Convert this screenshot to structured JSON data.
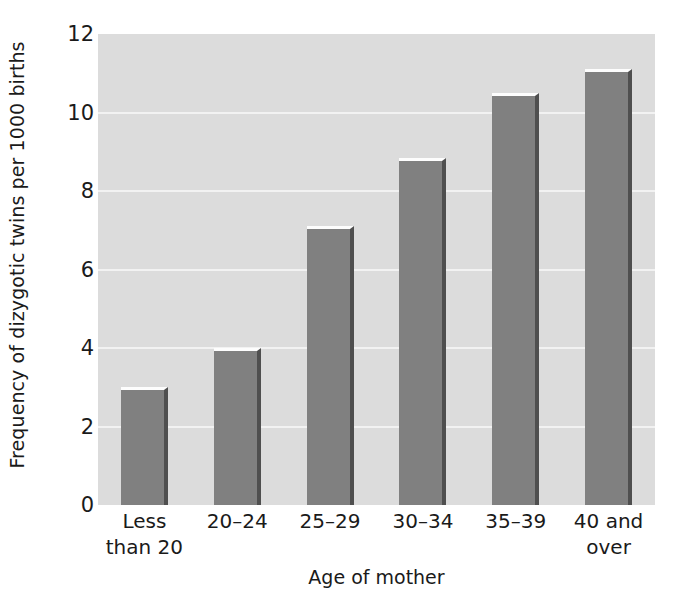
{
  "chart_data": {
    "type": "bar",
    "title": "",
    "xlabel": "Age of mother",
    "ylabel": "Frequency of dizygotic twins per 1000 births",
    "categories": [
      "Less than 20",
      "20–24",
      "25–29",
      "30–34",
      "35–39",
      "40 and over"
    ],
    "category_lines": [
      [
        "Less",
        "than 20"
      ],
      [
        "20–24",
        ""
      ],
      [
        "25–29",
        ""
      ],
      [
        "30–34",
        ""
      ],
      [
        "35–39",
        ""
      ],
      [
        "40 and",
        "over"
      ]
    ],
    "values": [
      3.0,
      4.0,
      7.1,
      8.85,
      10.5,
      11.1
    ],
    "ylim": [
      0,
      12
    ],
    "ytick_values": [
      0,
      2,
      4,
      6,
      8,
      10,
      12
    ],
    "ytick_labels": [
      "0",
      "2",
      "4",
      "6",
      "8",
      "10",
      "12"
    ],
    "grid": true,
    "grid_axis": "y",
    "legend": false,
    "colors": {
      "bar_fill": "#808080",
      "bar_shadow": "#4f4f4f",
      "bar_highlight": "#fdfdfd",
      "plot_background": "#dcdcdc",
      "gridline": "#f2f2f2",
      "figure_background": "#ffffff",
      "text": "#1a1a1a"
    }
  }
}
